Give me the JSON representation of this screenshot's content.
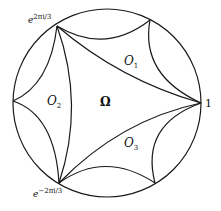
{
  "diagram": {
    "title": "",
    "vertices": {
      "one": "1",
      "top_left": {
        "base": "e",
        "exp": "2πi/3"
      },
      "bottom_left": {
        "base": "e",
        "exp": "−2πi/3"
      }
    },
    "regions": {
      "center": "Ω",
      "o1": {
        "base": "O",
        "sub": "1"
      },
      "o2": {
        "base": "O",
        "sub": "2"
      },
      "o3": {
        "base": "O",
        "sub": "3"
      }
    },
    "stroke_color": "#1a1a1a"
  }
}
